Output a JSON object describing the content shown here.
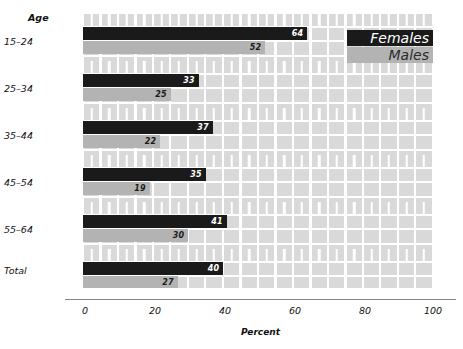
{
  "chart_data": {
    "type": "bar",
    "orientation": "horizontal",
    "title": "",
    "subtitle": "",
    "xlabel": "Percent",
    "ylabel": "Age",
    "group_header": "Age",
    "categories": [
      "15–24",
      "25–34",
      "35–44",
      "45–54",
      "55–64",
      "Total"
    ],
    "series": [
      {
        "name": "Females",
        "color": "#1a1a1a",
        "values": [
          64,
          33,
          37,
          35,
          41,
          40
        ]
      },
      {
        "name": "Males",
        "color": "#b3b3b3",
        "values": [
          52,
          25,
          22,
          19,
          30,
          27
        ]
      }
    ],
    "xlim": [
      0,
      100
    ],
    "xticks": [
      0,
      20,
      40,
      60,
      80,
      100
    ],
    "xtick_labels": [
      "0",
      "20",
      "40",
      "60",
      "80",
      "100"
    ],
    "grid": true,
    "grid_color": "#ffffff",
    "plot_background": "#d9d9d9",
    "legend_position": "top-right",
    "data_labels": true
  },
  "legend": {
    "entries": [
      {
        "label": "Females",
        "swatch": "females"
      },
      {
        "label": "Males",
        "swatch": "males"
      }
    ]
  }
}
